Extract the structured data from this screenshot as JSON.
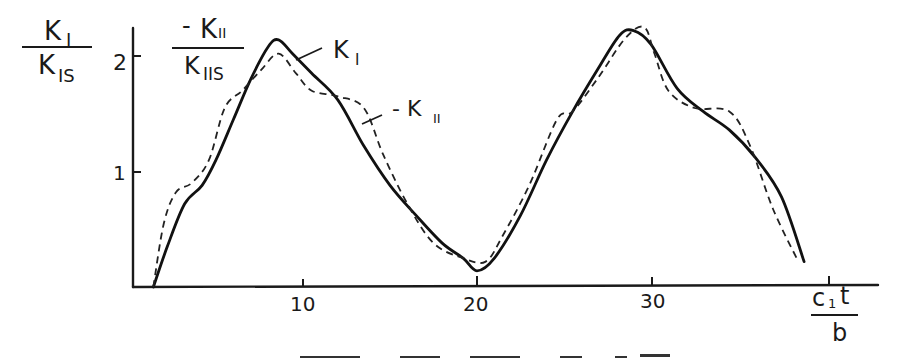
{
  "chart_data": {
    "type": "line",
    "title": "",
    "xlabel": "c1 t / b",
    "ylabel": "K_I / K_IS  and  -K_II / K_IIS",
    "y_axis_label_left": {
      "numerator": "K",
      "numerator_sub": "I",
      "denominator": "K",
      "denominator_sub": "IS"
    },
    "y_axis_label_right": {
      "numerator": "-K",
      "numerator_sub": "II",
      "denominator": "K",
      "denominator_sub": "IIS"
    },
    "x_axis_label": {
      "numerator": "c",
      "numerator_sub": "1",
      "numerator_tail": "t",
      "denominator": "b"
    },
    "xlim": [
      0,
      42
    ],
    "ylim": [
      0,
      2.3
    ],
    "x_ticks": [
      10,
      20,
      30,
      40
    ],
    "x_tick_labels": [
      "10",
      "20",
      "30",
      ""
    ],
    "y_ticks": [
      1,
      2
    ],
    "y_tick_labels": [
      "1",
      "2"
    ],
    "grid": false,
    "legend_position": "inline annotations with leader lines",
    "series": [
      {
        "name": "K_I",
        "label": "K",
        "label_sub": "I",
        "style": "solid",
        "x": [
          1.4,
          2.2,
          3.2,
          4.2,
          5.0,
          6.0,
          7.0,
          8.0,
          8.6,
          9.4,
          10.5,
          12.0,
          13.5,
          15.0,
          16.5,
          18.0,
          19.2,
          20.0,
          21.0,
          22.5,
          24.0,
          25.5,
          27.0,
          28.2,
          29.0,
          30.0,
          31.5,
          33.0,
          34.5,
          36.0,
          37.5,
          38.8
        ],
        "values": [
          0.0,
          0.35,
          0.72,
          0.88,
          1.1,
          1.45,
          1.8,
          2.08,
          2.14,
          2.02,
          1.85,
          1.62,
          1.22,
          0.88,
          0.62,
          0.38,
          0.25,
          0.14,
          0.25,
          0.62,
          1.1,
          1.52,
          1.9,
          2.18,
          2.22,
          2.1,
          1.72,
          1.52,
          1.36,
          1.12,
          0.78,
          0.22
        ]
      },
      {
        "name": "-K_II",
        "label": "- K",
        "label_sub": "II",
        "style": "dashed",
        "x": [
          1.4,
          2.0,
          2.7,
          3.6,
          4.6,
          5.5,
          6.5,
          7.6,
          8.6,
          9.6,
          10.5,
          12.0,
          13.5,
          14.6,
          16.0,
          17.5,
          19.2,
          20.5,
          21.5,
          23.0,
          24.6,
          25.5,
          27.0,
          28.5,
          29.6,
          30.2,
          31.0,
          32.5,
          34.5,
          35.7,
          37.0,
          38.4
        ],
        "values": [
          0.0,
          0.55,
          0.82,
          0.9,
          1.1,
          1.55,
          1.7,
          1.88,
          2.02,
          1.85,
          1.7,
          1.65,
          1.55,
          1.15,
          0.72,
          0.38,
          0.25,
          0.22,
          0.45,
          0.88,
          1.45,
          1.52,
          1.82,
          2.15,
          2.25,
          2.02,
          1.7,
          1.55,
          1.52,
          1.22,
          0.68,
          0.24
        ]
      }
    ]
  },
  "caption_fragment": "(partially cropped caption line at bottom edge)"
}
